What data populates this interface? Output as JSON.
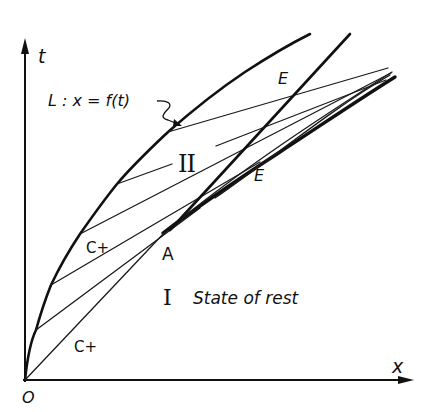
{
  "figure": {
    "axes": {
      "x_label": "x",
      "t_label": "t",
      "origin_label": "O"
    },
    "curve_L": {
      "label": "L : x = f(t)"
    },
    "regions": {
      "region_1": {
        "numeral": "I",
        "description": "State of rest"
      },
      "region_2": {
        "numeral": "II"
      }
    },
    "points": {
      "A": "A"
    },
    "characteristic_labels": {
      "upper": "C+",
      "lower": "C+"
    },
    "envelope_labels": {
      "upper_E": "E",
      "lower_E": "E"
    },
    "colors": {
      "ink": "#111111",
      "background": "#ffffff"
    }
  }
}
